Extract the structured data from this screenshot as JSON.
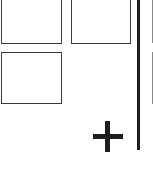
{
  "tiles": [
    {
      "id": "tile-1",
      "label": ""
    },
    {
      "id": "tile-2",
      "label": ""
    },
    {
      "id": "tile-3",
      "label": ""
    }
  ],
  "add_button": {
    "icon": "plus-icon",
    "label": "+"
  },
  "colors": {
    "border": "#3a3a3a",
    "divider": "#1e1e1e",
    "background": "#ffffff"
  }
}
